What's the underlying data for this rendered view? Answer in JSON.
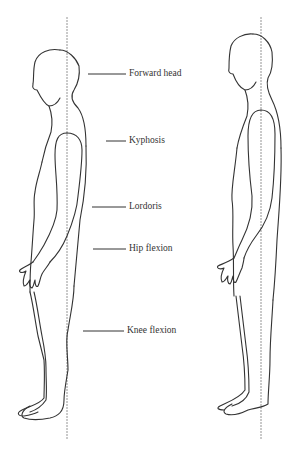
{
  "figure": {
    "left_figure": {
      "description": "Faulty posture (side view)",
      "labels": [
        {
          "text": "Forward head",
          "x": 129,
          "y": 69,
          "line_x1": 88,
          "line_x2": 126
        },
        {
          "text": "Kyphosis",
          "x": 129,
          "y": 137,
          "line_x1": 106,
          "line_x2": 126
        },
        {
          "text": "Lordoris",
          "x": 129,
          "y": 204,
          "line_x1": 92,
          "line_x2": 126
        },
        {
          "text": "Hip flexion",
          "x": 129,
          "y": 246,
          "line_x1": 93,
          "line_x2": 126
        },
        {
          "text": "Knee flexion",
          "x": 129,
          "y": 328,
          "line_x1": 83,
          "line_x2": 124
        }
      ]
    },
    "right_figure": {
      "description": "Ideal posture (side view)"
    },
    "colors": {
      "outline": "#333333",
      "plumb_line": "#888888",
      "background": "#ffffff"
    }
  }
}
